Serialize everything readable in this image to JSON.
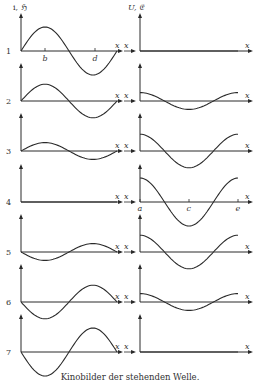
{
  "figure": {
    "left_axis_label": "i, ℌ",
    "right_axis_label": "U, 𝔈",
    "x_label": "x",
    "tick_labels_left": [
      "b",
      "d"
    ],
    "tick_labels_right": [
      "a",
      "c",
      "e"
    ],
    "row_labels": [
      "1",
      "2",
      "3",
      "4",
      "5",
      "6",
      "7"
    ],
    "caption": "Kinobilder der stehenden Welle."
  },
  "chart_data": {
    "type": "line",
    "title": "Kinobilder der stehenden Welle.",
    "panels": [
      {
        "name": "current / magnetic field (i, ℌ)",
        "shape": "sine over one wavelength",
        "amplitudes_by_frame": [
          1.0,
          0.7,
          0.35,
          0.0,
          -0.35,
          -0.7,
          -1.0
        ]
      },
      {
        "name": "voltage / electric field (U, 𝔈)",
        "shape": "cosine over one wavelength",
        "amplitudes_by_frame": [
          0.0,
          0.35,
          0.7,
          1.0,
          0.7,
          0.35,
          0.0
        ]
      }
    ],
    "frames": [
      "1",
      "2",
      "3",
      "4",
      "5",
      "6",
      "7"
    ],
    "xlabel": "x",
    "grid": false
  },
  "colors": {
    "line": "#2a2a2a",
    "background": "#ffffff"
  }
}
